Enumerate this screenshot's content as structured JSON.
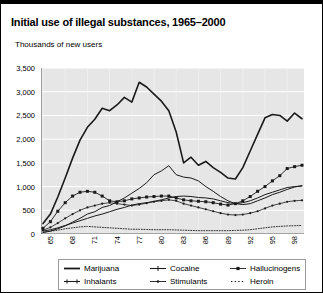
{
  "title": "Initial use of illegal substances, 1965–2000",
  "subtitle": "Thousands of new users",
  "axes": {
    "ylabel": "Thousands of new users",
    "yticks": [
      "0",
      "500",
      "1,000",
      "1,500",
      "2,000",
      "2,500",
      "3,000",
      "3,500"
    ],
    "xticks": [
      "65",
      "68",
      "71",
      "74",
      "77",
      "80",
      "83",
      "86",
      "89",
      "92",
      "95",
      "98"
    ]
  },
  "legend": {
    "items": [
      {
        "label": "Marijuana",
        "marker": "line-plain"
      },
      {
        "label": "Cocaine",
        "marker": "line-tick"
      },
      {
        "label": "Hallucinogens",
        "marker": "line-square"
      },
      {
        "label": "Inhalants",
        "marker": "line-dash"
      },
      {
        "label": "Stimulants",
        "marker": "line-dot"
      },
      {
        "label": "Heroin",
        "marker": "dotted"
      }
    ]
  },
  "colors": {
    "line": "#1a1a1a",
    "plot_background": "#e6e6e6",
    "gridline": "#ffffff",
    "border": "#000000"
  },
  "chart_data": {
    "type": "line",
    "title": "Initial use of illegal substances, 1965–2000",
    "subtitle": "Thousands of new users",
    "xlabel": "",
    "ylabel": "Thousands of new users",
    "ylim": [
      0,
      3500
    ],
    "ytick_step": 500,
    "grid": true,
    "legend_position": "bottom",
    "x": [
      1965,
      1966,
      1967,
      1968,
      1969,
      1970,
      1971,
      1972,
      1973,
      1974,
      1975,
      1976,
      1977,
      1978,
      1979,
      1980,
      1981,
      1982,
      1983,
      1984,
      1985,
      1986,
      1987,
      1988,
      1989,
      1990,
      1991,
      1992,
      1993,
      1994,
      1995,
      1996,
      1997,
      1998,
      1999,
      2000
    ],
    "series": [
      {
        "name": "Marijuana",
        "marker": "line-plain",
        "values": [
          220,
          420,
          780,
          1180,
          1600,
          1980,
          2250,
          2420,
          2650,
          2600,
          2720,
          2880,
          2780,
          3200,
          3100,
          2950,
          2800,
          2600,
          2150,
          1500,
          1620,
          1450,
          1530,
          1400,
          1300,
          1180,
          1160,
          1400,
          1750,
          2100,
          2450,
          2520,
          2500,
          2380,
          2550,
          2430
        ]
      },
      {
        "name": "Cocaine",
        "marker": "line-tick",
        "values": [
          30,
          60,
          110,
          170,
          250,
          330,
          420,
          470,
          560,
          600,
          680,
          760,
          860,
          960,
          1080,
          1250,
          1330,
          1440,
          1250,
          1200,
          1180,
          1120,
          1000,
          900,
          790,
          700,
          640,
          620,
          640,
          700,
          760,
          830,
          880,
          940,
          990,
          1020
        ]
      },
      {
        "name": "Hallucinogens",
        "marker": "line-square",
        "values": [
          120,
          260,
          480,
          660,
          800,
          880,
          900,
          880,
          800,
          700,
          680,
          700,
          740,
          760,
          780,
          790,
          800,
          800,
          760,
          720,
          700,
          690,
          680,
          660,
          630,
          610,
          640,
          700,
          790,
          900,
          1000,
          1120,
          1230,
          1380,
          1420,
          1450
        ]
      },
      {
        "name": "Inhalants",
        "marker": "line-dash",
        "values": [
          60,
          90,
          130,
          180,
          230,
          280,
          330,
          380,
          420,
          470,
          520,
          560,
          610,
          640,
          660,
          690,
          720,
          760,
          790,
          800,
          790,
          770,
          760,
          740,
          700,
          660,
          640,
          660,
          700,
          760,
          830,
          880,
          930,
          980,
          1000,
          1010
        ]
      },
      {
        "name": "Stimulants",
        "marker": "line-dot",
        "values": [
          80,
          140,
          230,
          330,
          420,
          500,
          560,
          600,
          640,
          660,
          640,
          620,
          600,
          620,
          650,
          680,
          700,
          720,
          700,
          640,
          600,
          560,
          520,
          480,
          440,
          410,
          400,
          410,
          440,
          480,
          540,
          600,
          640,
          680,
          700,
          710
        ]
      },
      {
        "name": "Heroin",
        "marker": "dotted",
        "values": [
          40,
          60,
          80,
          110,
          130,
          150,
          160,
          150,
          140,
          130,
          120,
          110,
          100,
          100,
          95,
          90,
          90,
          90,
          85,
          80,
          75,
          70,
          70,
          70,
          70,
          70,
          75,
          80,
          90,
          110,
          130,
          150,
          160,
          170,
          175,
          180
        ]
      }
    ]
  }
}
